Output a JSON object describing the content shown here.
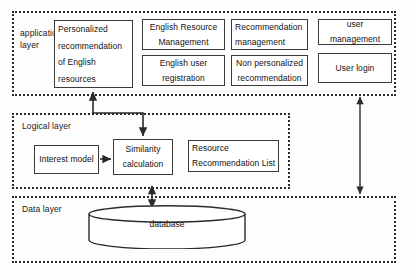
{
  "diagram": {
    "layers": [
      {
        "id": "application",
        "caption": "application\nlayer"
      },
      {
        "id": "logical",
        "caption": "Logical layer"
      },
      {
        "id": "data",
        "caption": "Data layer"
      }
    ],
    "application_layer": {
      "caption": "application\nlayer",
      "nodes": [
        {
          "id": "personalized-recommendation",
          "label": "Personalized\nrecommendation\nof English\nresources",
          "align": "left"
        },
        {
          "id": "english-resource-management",
          "label": "English Resource\nManagement",
          "align": "center"
        },
        {
          "id": "english-user-registration",
          "label": "English user\nregistration",
          "align": "center"
        },
        {
          "id": "recommendation-management",
          "label": "Recommendation\nmanagement",
          "align": "left"
        },
        {
          "id": "non-personalized-recommendation",
          "label": "Non personalized\nrecommendation",
          "align": "center"
        },
        {
          "id": "user-management",
          "label": "user management",
          "align": "center"
        },
        {
          "id": "user-login",
          "label": "User login",
          "align": "center"
        }
      ]
    },
    "logical_layer": {
      "caption": "Logical layer",
      "nodes": [
        {
          "id": "interest-model",
          "label": "Interest model",
          "align": "center"
        },
        {
          "id": "similarity-calculation",
          "label": "Similarity\ncalculation",
          "align": "center"
        },
        {
          "id": "resource-recommendation-list",
          "label": "Resource\nRecommendation List",
          "align": "left"
        }
      ]
    },
    "data_layer": {
      "caption": "Data layer",
      "nodes": [
        {
          "id": "database",
          "label": "database",
          "shape": "cylinder"
        }
      ]
    },
    "connectors": [
      {
        "id": "app-to-similarity",
        "from": "application-layer",
        "to": "similarity-calculation",
        "style": "elbow",
        "arrows": "both-ends"
      },
      {
        "id": "logical-to-database",
        "from": "logical-layer",
        "to": "database",
        "style": "vertical",
        "arrows": "double"
      },
      {
        "id": "application-to-data",
        "from": "application-layer",
        "to": "data-layer",
        "style": "vertical",
        "arrows": "double"
      }
    ],
    "colors": {
      "frame_border": "#2a2a2a",
      "node_border": "#3a3a3a",
      "node_fill": "#ffffff",
      "text": "#121212",
      "background": "#fdfdfd",
      "connector": "#2a2a2a"
    }
  }
}
